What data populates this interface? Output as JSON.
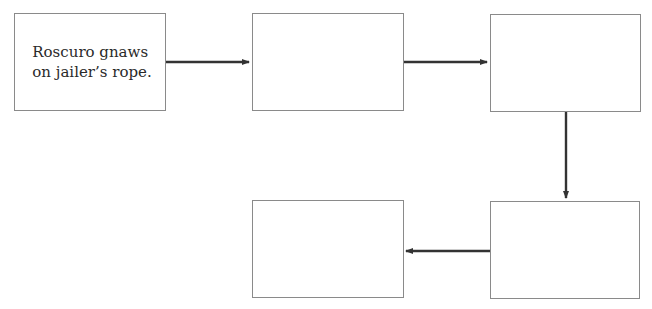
{
  "diagram": {
    "type": "flowchart",
    "colors": {
      "box_border": "#8a8a8a",
      "arrow": "#333333",
      "text": "#2a2a2a",
      "background": "#ffffff"
    },
    "boxes": [
      {
        "id": "box-1",
        "text": "Roscuro gnaws\non jailer’s rope."
      },
      {
        "id": "box-2",
        "text": ""
      },
      {
        "id": "box-3",
        "text": ""
      },
      {
        "id": "box-4",
        "text": ""
      },
      {
        "id": "box-5",
        "text": ""
      }
    ],
    "arrows": [
      {
        "from": "box-1",
        "to": "box-2",
        "direction": "right"
      },
      {
        "from": "box-2",
        "to": "box-3",
        "direction": "right"
      },
      {
        "from": "box-3",
        "to": "box-4",
        "direction": "down"
      },
      {
        "from": "box-4",
        "to": "box-5",
        "direction": "left"
      }
    ]
  }
}
